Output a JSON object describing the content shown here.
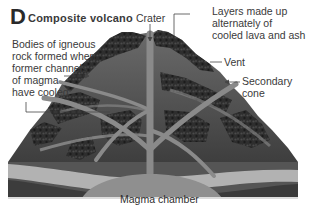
{
  "figure": {
    "letter": "D",
    "title": "Composite volcano"
  },
  "labels": {
    "crater": "Crater",
    "layers_line1": "Layers made up",
    "layers_line2": "alternately of",
    "layers_line3": "cooled lava and ash",
    "vent": "Vent",
    "secondary_line1": "Secondary",
    "secondary_line2": "cone",
    "bodies_line1": "Bodies of igneous",
    "bodies_line2": "rock formed when",
    "bodies_line3": "former channels",
    "bodies_line4": "of magma",
    "bodies_line5": "have cooled",
    "magma_chamber": "Magma chamber"
  },
  "colors": {
    "background": "#ffffff",
    "text": "#3a3a3a",
    "rock_dark": "#2b2b2b",
    "rock_mid": "#5a5a5a",
    "channel": "#8a8a8a",
    "lava_light": "#b8b8b8"
  }
}
